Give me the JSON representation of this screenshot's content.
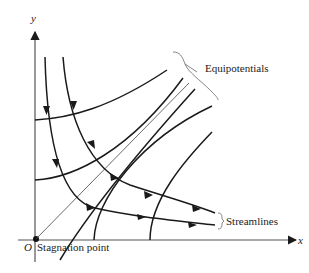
{
  "diagram": {
    "axes": {
      "x_label": "x",
      "y_label": "y",
      "origin_label": "O"
    },
    "labels": {
      "equipotentials": "Equipotentials",
      "streamlines": "Streamlines",
      "stagnation_point": "Stagnation point"
    },
    "colors": {
      "line": "#1a1a1a",
      "axis": "#555555",
      "text": "#222222"
    }
  }
}
